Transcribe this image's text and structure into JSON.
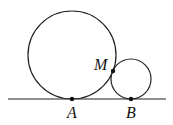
{
  "diagram": {
    "line": {
      "x1": 8,
      "y1": 99,
      "x2": 166,
      "y2": 99
    },
    "circles": [
      {
        "name": "large-circle",
        "cx": 72,
        "cy": 55,
        "r": 44
      },
      {
        "name": "small-circle",
        "cx": 131,
        "cy": 79,
        "r": 20
      }
    ],
    "points": [
      {
        "name": "M",
        "label": "M",
        "x": 113,
        "y": 71,
        "label_x": 94,
        "label_y": 70
      },
      {
        "name": "A",
        "label": "A",
        "x": 72,
        "y": 99,
        "label_x": 67,
        "label_y": 118
      },
      {
        "name": "B",
        "label": "B",
        "x": 131,
        "y": 99,
        "label_x": 126,
        "label_y": 118
      }
    ],
    "stroke_color": "#222222"
  }
}
